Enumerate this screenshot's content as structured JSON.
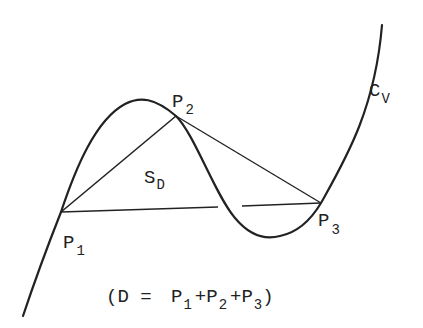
{
  "diagram": {
    "curve_label": {
      "base": "C",
      "sub": "V"
    },
    "region_label": {
      "base": "S",
      "sub": "D"
    },
    "points": [
      {
        "base": "P",
        "sub": "1"
      },
      {
        "base": "P",
        "sub": "2"
      },
      {
        "base": "P",
        "sub": "3"
      }
    ],
    "caption": {
      "open": "(D = ",
      "terms": [
        {
          "base": "P",
          "sub": "1"
        },
        {
          "base": "P",
          "sub": "2"
        },
        {
          "base": "P",
          "sub": "3"
        }
      ],
      "plus": "+",
      "close": ")"
    },
    "colors": {
      "stroke": "#222222",
      "background": "#ffffff"
    }
  }
}
